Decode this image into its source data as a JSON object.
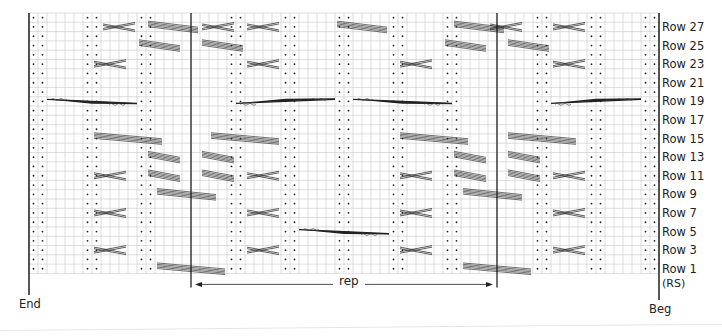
{
  "chart_data": {
    "type": "table",
    "grid": {
      "columns": 70,
      "rows": 28,
      "left": 29,
      "top": 13,
      "cell_w": 9,
      "cell_h": 9.3
    },
    "row_labels": [
      "Row 27",
      "Row 25",
      "Row 23",
      "Row 21",
      "Row 19",
      "Row 17",
      "Row 15",
      "Row 13",
      "Row 11",
      "Row 9",
      "Row 7",
      "Row 5",
      "Row 3",
      "Row 1"
    ],
    "rs_label": "(RS)",
    "end_label": "End",
    "beg_label": "Beg",
    "rep_label": "rep",
    "rep_columns": [
      18,
      52
    ],
    "purl_columns": [
      0,
      1,
      6,
      7,
      12,
      13,
      22,
      23,
      28,
      29,
      34,
      35,
      40,
      41,
      46,
      47,
      56,
      57,
      62,
      63,
      68,
      69
    ],
    "cables": [
      {
        "c0": 8,
        "c1": 12,
        "r": 1,
        "kind": "cross"
      },
      {
        "c0": 13,
        "c1": 19,
        "r": 1,
        "kind": "band"
      },
      {
        "c0": 19,
        "c1": 23,
        "r": 1,
        "kind": "cross"
      },
      {
        "c0": 24,
        "c1": 28,
        "r": 1,
        "kind": "cross"
      },
      {
        "c0": 34,
        "c1": 40,
        "r": 1,
        "kind": "band"
      },
      {
        "c0": 47,
        "c1": 53,
        "r": 1,
        "kind": "band"
      },
      {
        "c0": 51,
        "c1": 55,
        "r": 1,
        "kind": "cross"
      },
      {
        "c0": 58,
        "c1": 62,
        "r": 1,
        "kind": "cross"
      },
      {
        "c0": 12,
        "c1": 17,
        "r": 3,
        "kind": "band"
      },
      {
        "c0": 19,
        "c1": 24,
        "r": 3,
        "kind": "band"
      },
      {
        "c0": 46,
        "c1": 51,
        "r": 3,
        "kind": "band"
      },
      {
        "c0": 53,
        "c1": 58,
        "r": 3,
        "kind": "band"
      },
      {
        "c0": 7,
        "c1": 11,
        "r": 5,
        "kind": "cross"
      },
      {
        "c0": 24,
        "c1": 28,
        "r": 5,
        "kind": "cross"
      },
      {
        "c0": 41,
        "c1": 45,
        "r": 5,
        "kind": "cross"
      },
      {
        "c0": 58,
        "c1": 62,
        "r": 5,
        "kind": "cross"
      },
      {
        "c0": 2,
        "c1": 12,
        "r": 9,
        "kind": "long-right"
      },
      {
        "c0": 23,
        "c1": 34,
        "r": 9,
        "kind": "long-left"
      },
      {
        "c0": 36,
        "c1": 47,
        "r": 9,
        "kind": "long-right"
      },
      {
        "c0": 58,
        "c1": 68,
        "r": 9,
        "kind": "long-left"
      },
      {
        "c0": 7,
        "c1": 15,
        "r": 13,
        "kind": "band"
      },
      {
        "c0": 20,
        "c1": 28,
        "r": 13,
        "kind": "band"
      },
      {
        "c0": 41,
        "c1": 49,
        "r": 13,
        "kind": "band"
      },
      {
        "c0": 53,
        "c1": 61,
        "r": 13,
        "kind": "band"
      },
      {
        "c0": 13,
        "c1": 17,
        "r": 15,
        "kind": "band"
      },
      {
        "c0": 19,
        "c1": 23,
        "r": 15,
        "kind": "band"
      },
      {
        "c0": 47,
        "c1": 51,
        "r": 15,
        "kind": "band"
      },
      {
        "c0": 53,
        "c1": 57,
        "r": 15,
        "kind": "band"
      },
      {
        "c0": 7,
        "c1": 11,
        "r": 17,
        "kind": "cross"
      },
      {
        "c0": 13,
        "c1": 17,
        "r": 17,
        "kind": "band"
      },
      {
        "c0": 19,
        "c1": 23,
        "r": 17,
        "kind": "band"
      },
      {
        "c0": 24,
        "c1": 28,
        "r": 17,
        "kind": "cross"
      },
      {
        "c0": 41,
        "c1": 45,
        "r": 17,
        "kind": "cross"
      },
      {
        "c0": 47,
        "c1": 51,
        "r": 17,
        "kind": "band"
      },
      {
        "c0": 53,
        "c1": 57,
        "r": 17,
        "kind": "band"
      },
      {
        "c0": 58,
        "c1": 62,
        "r": 17,
        "kind": "cross"
      },
      {
        "c0": 14,
        "c1": 21,
        "r": 19,
        "kind": "band"
      },
      {
        "c0": 48,
        "c1": 55,
        "r": 19,
        "kind": "band"
      },
      {
        "c0": 7,
        "c1": 11,
        "r": 21,
        "kind": "cross"
      },
      {
        "c0": 24,
        "c1": 28,
        "r": 21,
        "kind": "cross"
      },
      {
        "c0": 41,
        "c1": 45,
        "r": 21,
        "kind": "cross"
      },
      {
        "c0": 58,
        "c1": 62,
        "r": 21,
        "kind": "cross"
      },
      {
        "c0": 30,
        "c1": 40,
        "r": 23,
        "kind": "long-right"
      },
      {
        "c0": 7,
        "c1": 11,
        "r": 25,
        "kind": "cross"
      },
      {
        "c0": 24,
        "c1": 28,
        "r": 25,
        "kind": "cross"
      },
      {
        "c0": 41,
        "c1": 45,
        "r": 25,
        "kind": "cross"
      },
      {
        "c0": 58,
        "c1": 62,
        "r": 25,
        "kind": "cross"
      },
      {
        "c0": 14,
        "c1": 22,
        "r": 27,
        "kind": "band"
      },
      {
        "c0": 48,
        "c1": 56,
        "r": 27,
        "kind": "band"
      }
    ]
  }
}
